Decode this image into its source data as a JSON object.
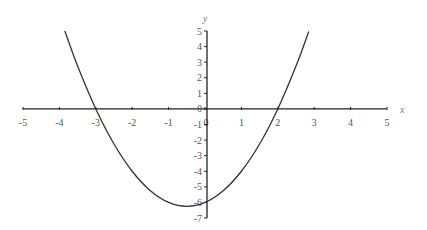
{
  "chart_data": {
    "type": "line",
    "title": "",
    "xlabel": "x",
    "ylabel": "y",
    "xlim": [
      -5,
      5
    ],
    "ylim": [
      -7,
      5
    ],
    "grid": false,
    "legend": null,
    "x_ticks": [
      -5,
      -4,
      -3,
      -2,
      -1,
      0,
      1,
      2,
      3,
      4,
      5
    ],
    "y_ticks": [
      5,
      4,
      3,
      2,
      1,
      0,
      -1,
      -2,
      -3,
      -4,
      -5,
      -6,
      -7
    ],
    "series": [
      {
        "name": "y = x^2 + x - 6",
        "color": "#333333",
        "x": [
          -3.85,
          -3.5,
          -3,
          -2.5,
          -2,
          -1.5,
          -1,
          -0.5,
          0,
          0.5,
          1,
          1.5,
          2,
          2.5,
          2.85
        ],
        "values": [
          5.0,
          2.75,
          0,
          -2.25,
          -4,
          -5.25,
          -6,
          -6.25,
          -6,
          -5.25,
          -4,
          -2.25,
          0,
          2.75,
          4.97
        ]
      }
    ],
    "annotations": {
      "roots": [
        -3,
        2
      ],
      "vertex": [
        -0.5,
        -6.25
      ],
      "y_intercept": -6
    }
  }
}
